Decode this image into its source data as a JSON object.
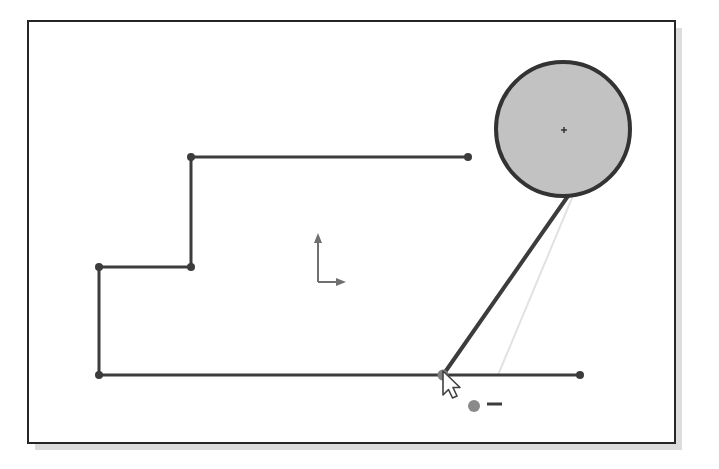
{
  "app": {
    "title": "CAD Polyline Editor Canvas",
    "description": "Vector drawing canvas showing a stepped polyline sketch, a shaded circle with center cross mark, a construction axis indicator, and a mouse cursor hovering a selected vertex with a delete-point badge."
  },
  "colors": {
    "page_background": "#ffffff",
    "canvas_fill": "#ffffff",
    "frame_stroke": "#262626",
    "drop_shadow": "#dcdcdc",
    "geometry_stroke": "#3c3c3c",
    "vertex_fill": "#3c3c3c",
    "selected_vertex_fill": "#808080",
    "circle_fill": "#c2c2c2",
    "circle_stroke": "#333333",
    "center_mark_stroke": "#2b2b2b",
    "axis_stroke": "#707070",
    "construction_line": "#e2e2e2",
    "cursor_fill": "#ffffff",
    "cursor_stroke": "#404040",
    "badge_dot_fill": "#8a8a8a",
    "badge_minus_stroke": "#3c3c3c"
  },
  "canvas_frame": {
    "name": "drawing-frame",
    "x": 28,
    "y": 21,
    "width": 647,
    "height": 422,
    "stroke_width": 2,
    "shadow_offset_x": 7,
    "shadow_offset_y": 7
  },
  "geometry": {
    "stroke_width": 3,
    "vertex_radius": 4,
    "polyline": {
      "name": "stepped-polyline",
      "label": "Stepped polyline profile",
      "points": [
        {
          "name": "vertex-top-right-end",
          "x": 468,
          "y": 157,
          "selected": false
        },
        {
          "name": "vertex-top-left-corner",
          "x": 191,
          "y": 157,
          "selected": false
        },
        {
          "name": "vertex-mid-step-corner",
          "x": 191,
          "y": 267,
          "selected": false
        },
        {
          "name": "vertex-mid-left-end",
          "x": 99,
          "y": 267,
          "selected": false
        },
        {
          "name": "vertex-bottom-left-corner",
          "x": 99,
          "y": 375,
          "selected": false
        },
        {
          "name": "vertex-bottom-selected",
          "x": 443,
          "y": 375,
          "selected": true
        },
        {
          "name": "vertex-bottom-right-end",
          "x": 580,
          "y": 375,
          "selected": false
        }
      ],
      "segments": [
        {
          "name": "segment-top-horizontal",
          "x1": 468,
          "y1": 157,
          "x2": 191,
          "y2": 157
        },
        {
          "name": "segment-upper-vertical",
          "x1": 191,
          "y1": 157,
          "x2": 191,
          "y2": 267
        },
        {
          "name": "segment-mid-horizontal",
          "x1": 191,
          "y1": 267,
          "x2": 99,
          "y2": 267
        },
        {
          "name": "segment-lower-vertical",
          "x1": 99,
          "y1": 267,
          "x2": 99,
          "y2": 375
        },
        {
          "name": "segment-bottom-horizontal-left",
          "x1": 99,
          "y1": 375,
          "x2": 443,
          "y2": 375
        },
        {
          "name": "segment-bottom-horizontal-right",
          "x1": 443,
          "y1": 375,
          "x2": 580,
          "y2": 375
        }
      ]
    },
    "leader_line": {
      "name": "leader-line-to-circle",
      "x1": 443,
      "y1": 375,
      "x2": 568,
      "y2": 196,
      "stroke_width": 4
    },
    "construction_line": {
      "name": "construction-guide-line",
      "x1": 498,
      "y1": 375,
      "x2": 572,
      "y2": 198,
      "stroke_width": 2
    },
    "circle": {
      "name": "shaded-circle",
      "label": "Filled circle entity",
      "center_x": 563,
      "center_y": 129,
      "radius": 67,
      "stroke_width": 4,
      "center_mark": {
        "name": "center-cross-mark",
        "x": 564,
        "y": 130,
        "size": 6
      }
    }
  },
  "axis_indicator": {
    "name": "origin-axis-indicator",
    "label": "Coordinate axis indicator",
    "origin_x": 318,
    "origin_y": 282,
    "y_axis_length": 44,
    "x_axis_length": 23,
    "stroke_width": 2
  },
  "cursor": {
    "name": "mouse-pointer",
    "label": "Arrow pointer over selected vertex",
    "tip_x": 443,
    "tip_y": 371,
    "scale": 1.0
  },
  "cursor_badge": {
    "name": "delete-point-badge",
    "label": "Remove point indicator",
    "dot_x": 474,
    "dot_y": 406,
    "dot_radius": 6,
    "minus_x1": 487,
    "minus_x2": 502,
    "minus_y": 404,
    "minus_stroke_width": 3
  }
}
